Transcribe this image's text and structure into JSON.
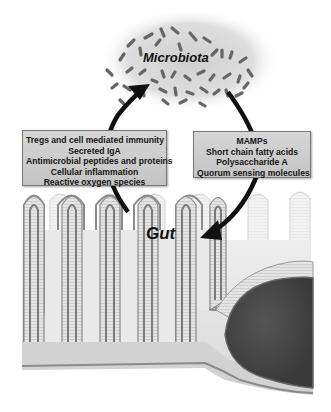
{
  "diagram": {
    "title_top": "Microbiota",
    "title_bottom": "Gut",
    "left_box": {
      "items": [
        "Tregs and cell mediated immunity",
        "Secreted IgA",
        "Antimicrobial peptides and proteins",
        "Cellular inflammation",
        "Reactive oxygen species"
      ]
    },
    "right_box": {
      "items": [
        "MAMPs",
        "Short chain fatty acids",
        "Polysaccharide A",
        "Quorum sensing molecules"
      ]
    },
    "arrows": [
      {
        "from": "Gut",
        "to": "Microbiota",
        "side": "left"
      },
      {
        "from": "Microbiota",
        "to": "Gut",
        "side": "right"
      }
    ],
    "colors": {
      "box_fill": "#cfcfcf",
      "cloud": "#d9d9d9",
      "bacteria": "#6a6a6a",
      "tissue": "#dcdcdc",
      "epithelium": "#8c8c8c",
      "lymphoid_nodule": "#4a4a4a",
      "arrow": "#111111"
    }
  }
}
